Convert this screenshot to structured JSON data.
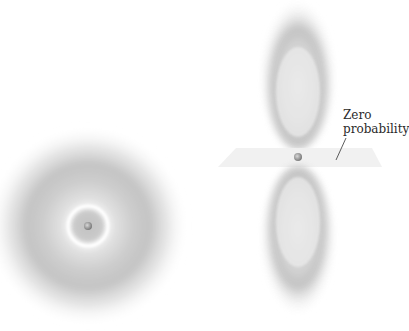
{
  "diagram": {
    "orbital_s": {
      "name": "2s-orbital",
      "center": [
        88,
        226
      ],
      "outer_radius": 100,
      "node_radius": 21
    },
    "orbital_p": {
      "name": "2p-orbital",
      "upper_lobe": {
        "cx": 298,
        "cy": 65
      },
      "lower_lobe": {
        "cx": 298,
        "cy": 240
      },
      "nucleus": [
        298,
        157
      ]
    },
    "nodal_plane": {
      "points": "236,148 372,148 382,167 218,167"
    },
    "annotation": {
      "line1": "Zero",
      "line2": "probability"
    },
    "colors": {
      "cloud": "#8a8a8a",
      "plane": "#eeeeee",
      "text": "#2a2a2a"
    }
  }
}
